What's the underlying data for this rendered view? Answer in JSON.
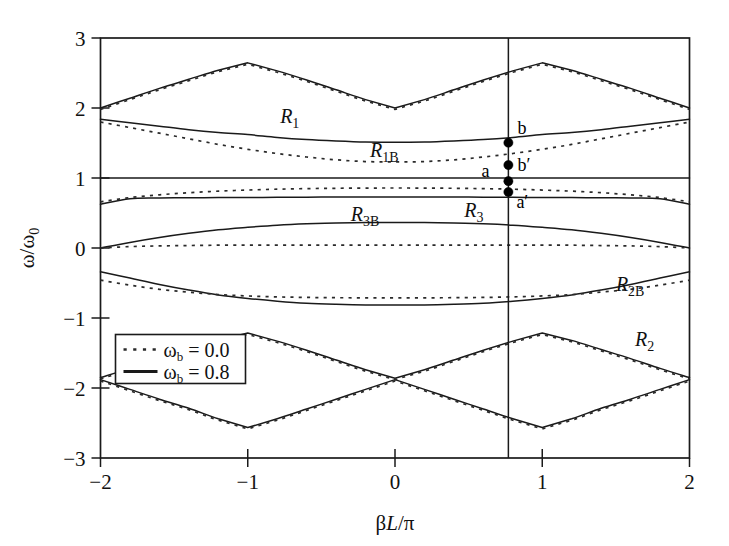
{
  "figure": {
    "background": "#ffffff",
    "ink_color": "#1a1a1a"
  },
  "axis": {
    "x_label_main": "L/",
    "x_label_pre": "β",
    "x_label_post": "π",
    "x_label_full": "βL/π",
    "y_label_full": "ω/ω₀",
    "x_ticks": [
      "-2",
      "-1",
      "0",
      "1",
      "2"
    ],
    "x_tick_values": [
      -2,
      -1,
      0,
      1,
      2
    ],
    "y_ticks": [
      "3",
      "2",
      "1",
      "0",
      "-1",
      "-2",
      "-3"
    ],
    "y_tick_values": [
      3,
      2,
      1,
      0,
      -1,
      -2,
      -3
    ],
    "xlim": [
      -2,
      2
    ],
    "ylim": [
      -3,
      3
    ]
  },
  "legend": {
    "position": "lower-left-inside",
    "entries": [
      {
        "label_pre": "ω",
        "label_sub": "b",
        "label_post": " = 0.0",
        "style": "dotted",
        "value": "0.0"
      },
      {
        "label_pre": "ω",
        "label_sub": "b",
        "label_post": " = 0.8",
        "style": "solid",
        "value": "0.8"
      }
    ]
  },
  "band_labels": [
    {
      "name": "R1",
      "base": "R",
      "sub": "1",
      "x": -0.78,
      "y": 1.78
    },
    {
      "name": "R1B",
      "base": "R",
      "sub": "1B",
      "x": -0.17,
      "y": 1.3
    },
    {
      "name": "R3B",
      "base": "R",
      "sub": "3B",
      "x": -0.3,
      "y": 0.38
    },
    {
      "name": "R3",
      "base": "R",
      "sub": "3",
      "x": 0.47,
      "y": 0.45
    },
    {
      "name": "R2B",
      "base": "R",
      "sub": "2B",
      "x": 1.5,
      "y": -0.62
    },
    {
      "name": "R2",
      "base": "R",
      "sub": "2",
      "x": 1.63,
      "y": -1.4
    }
  ],
  "marker_line": {
    "x": 0.77,
    "description": "vertical operating-point line"
  },
  "marked_points": [
    {
      "label": "b",
      "x": 0.77,
      "y": 1.505,
      "label_dx": 9,
      "label_dy": -9
    },
    {
      "label": "b′",
      "x": 0.77,
      "y": 1.185,
      "label_dx": 9,
      "label_dy": 6
    },
    {
      "label": "a",
      "x": 0.77,
      "y": 0.955,
      "label_dx": -19,
      "label_dy": -4
    },
    {
      "label": "a′",
      "x": 0.77,
      "y": 0.8,
      "label_dx": 8,
      "label_dy": 16
    }
  ],
  "chart_data": {
    "type": "line",
    "title": "",
    "xlabel": "βL/π",
    "ylabel": "ω/ω₀",
    "xlim": [
      -2,
      2
    ],
    "ylim": [
      -3,
      3
    ],
    "grid": false,
    "legend_position": "lower left",
    "x_ticks": [
      -2,
      -1,
      0,
      1,
      2
    ],
    "y_ticks": [
      -3,
      -2,
      -1,
      0,
      1,
      2,
      3
    ],
    "x": [
      -2.0,
      -1.8,
      -1.6,
      -1.4,
      -1.2,
      -1.0,
      -0.8,
      -0.6,
      -0.4,
      -0.2,
      0.0,
      0.2,
      0.4,
      0.6,
      0.8,
      1.0,
      1.2,
      1.4,
      1.6,
      1.8,
      2.0
    ],
    "series": [
      {
        "name": "R1 upper (wb=0.8)",
        "style": "solid",
        "band": "R1",
        "values": [
          2.0,
          2.14,
          2.28,
          2.41,
          2.54,
          2.645,
          2.53,
          2.4,
          2.26,
          2.12,
          2.0,
          2.12,
          2.26,
          2.4,
          2.53,
          2.645,
          2.54,
          2.41,
          2.28,
          2.14,
          2.0
        ]
      },
      {
        "name": "R1 upper (wb=0.0)",
        "style": "dotted",
        "band": "R1",
        "values": [
          1.98,
          2.12,
          2.26,
          2.39,
          2.52,
          2.625,
          2.51,
          2.38,
          2.24,
          2.1,
          1.98,
          2.1,
          2.24,
          2.38,
          2.51,
          2.625,
          2.52,
          2.39,
          2.26,
          2.12,
          1.98
        ]
      },
      {
        "name": "R1B lower (wb=0.8)",
        "style": "solid",
        "band": "R1B",
        "values": [
          1.84,
          1.79,
          1.74,
          1.69,
          1.65,
          1.62,
          1.58,
          1.55,
          1.53,
          1.515,
          1.51,
          1.515,
          1.53,
          1.55,
          1.58,
          1.62,
          1.65,
          1.69,
          1.74,
          1.79,
          1.84
        ]
      },
      {
        "name": "R1B lower (wb=0.0)",
        "style": "dotted",
        "band": "R1B",
        "values": [
          1.8,
          1.72,
          1.64,
          1.56,
          1.48,
          1.41,
          1.35,
          1.3,
          1.26,
          1.235,
          1.23,
          1.235,
          1.26,
          1.3,
          1.35,
          1.41,
          1.48,
          1.56,
          1.64,
          1.72,
          1.8
        ]
      },
      {
        "name": "flat line w=1 (wb=0.8)",
        "style": "solid",
        "band": "boundary",
        "values": [
          1.0,
          1.0,
          1.0,
          1.0,
          1.0,
          1.0,
          1.0,
          1.0,
          1.0,
          1.0,
          1.0,
          1.0,
          1.0,
          1.0,
          1.0,
          1.0,
          1.0,
          1.0,
          1.0,
          1.0,
          1.0
        ]
      },
      {
        "name": "R3 upper (wb=0.8)",
        "style": "solid",
        "band": "R3",
        "values": [
          0.625,
          0.705,
          0.715,
          0.718,
          0.72,
          0.722,
          0.724,
          0.726,
          0.728,
          0.729,
          0.73,
          0.729,
          0.728,
          0.726,
          0.724,
          0.722,
          0.72,
          0.718,
          0.715,
          0.705,
          0.625
        ]
      },
      {
        "name": "R3 upper (wb=0.0)",
        "style": "dotted",
        "band": "R3",
        "values": [
          0.66,
          0.72,
          0.76,
          0.79,
          0.812,
          0.828,
          0.84,
          0.848,
          0.853,
          0.856,
          0.857,
          0.856,
          0.853,
          0.848,
          0.84,
          0.828,
          0.812,
          0.79,
          0.76,
          0.72,
          0.66
        ]
      },
      {
        "name": "R3B (wb=0.8)",
        "style": "solid",
        "band": "R3B",
        "values": [
          0.0,
          0.08,
          0.15,
          0.21,
          0.26,
          0.295,
          0.325,
          0.345,
          0.358,
          0.364,
          0.366,
          0.364,
          0.358,
          0.345,
          0.325,
          0.295,
          0.26,
          0.21,
          0.15,
          0.08,
          0.0
        ]
      },
      {
        "name": "R3B (wb=0.0)",
        "style": "dotted",
        "band": "R3B",
        "values": [
          0.0,
          0.02,
          0.03,
          0.035,
          0.04,
          0.04,
          0.04,
          0.04,
          0.04,
          0.04,
          0.04,
          0.04,
          0.04,
          0.04,
          0.04,
          0.04,
          0.04,
          0.035,
          0.03,
          0.02,
          0.0
        ]
      },
      {
        "name": "R2B upper (wb=0.8)",
        "style": "solid",
        "band": "R2B",
        "values": [
          -0.34,
          -0.43,
          -0.52,
          -0.6,
          -0.67,
          -0.72,
          -0.76,
          -0.79,
          -0.805,
          -0.813,
          -0.815,
          -0.813,
          -0.805,
          -0.79,
          -0.76,
          -0.72,
          -0.67,
          -0.6,
          -0.52,
          -0.43,
          -0.34
        ]
      },
      {
        "name": "R2B upper (wb=0.0)",
        "style": "dotted",
        "band": "R2B",
        "values": [
          -0.46,
          -0.53,
          -0.59,
          -0.63,
          -0.665,
          -0.685,
          -0.698,
          -0.706,
          -0.71,
          -0.712,
          -0.713,
          -0.712,
          -0.71,
          -0.706,
          -0.698,
          -0.685,
          -0.665,
          -0.63,
          -0.59,
          -0.53,
          -0.46
        ]
      },
      {
        "name": "R2 upper (wb=0.8)",
        "style": "solid",
        "band": "R2",
        "values": [
          -1.85,
          -1.72,
          -1.58,
          -1.45,
          -1.32,
          -1.215,
          -1.33,
          -1.46,
          -1.6,
          -1.74,
          -1.86,
          -1.74,
          -1.6,
          -1.46,
          -1.33,
          -1.215,
          -1.32,
          -1.45,
          -1.58,
          -1.72,
          -1.85
        ]
      },
      {
        "name": "R2 lower (wb=0.8)",
        "style": "solid",
        "band": "R2",
        "values": [
          -1.88,
          -2.02,
          -2.16,
          -2.29,
          -2.44,
          -2.565,
          -2.44,
          -2.3,
          -2.16,
          -2.02,
          -1.88,
          -2.02,
          -2.16,
          -2.3,
          -2.44,
          -2.565,
          -2.44,
          -2.29,
          -2.16,
          -2.02,
          -1.88
        ]
      },
      {
        "name": "R2 upper (wb=0.0)",
        "style": "dotted",
        "band": "R2",
        "values": [
          -1.87,
          -1.74,
          -1.6,
          -1.47,
          -1.34,
          -1.235,
          -1.35,
          -1.48,
          -1.62,
          -1.76,
          -1.88,
          -1.76,
          -1.62,
          -1.48,
          -1.35,
          -1.235,
          -1.34,
          -1.47,
          -1.6,
          -1.74,
          -1.87
        ]
      },
      {
        "name": "R2 lower (wb=0.0)",
        "style": "dotted",
        "band": "R2",
        "values": [
          -1.9,
          -2.04,
          -2.18,
          -2.31,
          -2.46,
          -2.585,
          -2.46,
          -2.32,
          -2.18,
          -2.04,
          -1.9,
          -2.04,
          -2.18,
          -2.32,
          -2.46,
          -2.585,
          -2.46,
          -2.31,
          -2.18,
          -2.04,
          -1.9
        ]
      }
    ]
  }
}
